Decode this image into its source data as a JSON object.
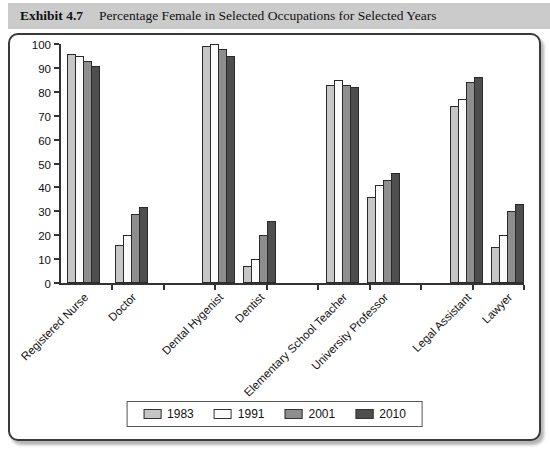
{
  "exhibit": {
    "label": "Exhibit 4.7",
    "title": "Percentage Female in Selected Occupations for Selected Years"
  },
  "chart_data": {
    "type": "bar",
    "title": "Percentage Female in Selected Occupations for Selected Years",
    "categories": [
      "Registered Nurse",
      "Doctor",
      "Dental Hygenist",
      "Dentist",
      "Elementary School Teacher",
      "University Professor",
      "Legal Assistant",
      "Lawyer"
    ],
    "series": [
      {
        "name": "1983",
        "color": "#c6c6c6",
        "values": [
          96,
          16,
          99,
          7,
          83,
          36,
          74,
          15
        ]
      },
      {
        "name": "1991",
        "color": "#fbfbfb",
        "values": [
          95,
          20,
          100,
          10,
          85,
          41,
          77,
          20
        ]
      },
      {
        "name": "2001",
        "color": "#8e8e8e",
        "values": [
          93,
          29,
          98,
          20,
          83,
          43,
          84,
          30
        ]
      },
      {
        "name": "2010",
        "color": "#4e4e4e",
        "values": [
          91,
          32,
          95,
          26,
          82,
          46,
          86,
          33
        ]
      }
    ],
    "xlabel": "",
    "ylabel": "",
    "ylim": [
      0,
      100
    ],
    "ytick_step": 10,
    "grid": false,
    "legend_position": "bottom",
    "legend_labels": [
      "1983",
      "1991",
      "2001",
      "2010"
    ]
  },
  "colors": {
    "titlebar_bg": "#cbcbcb",
    "panel_border": "#3a3a3a",
    "axis": "#333333",
    "bar_border": "#2a2a2a"
  }
}
